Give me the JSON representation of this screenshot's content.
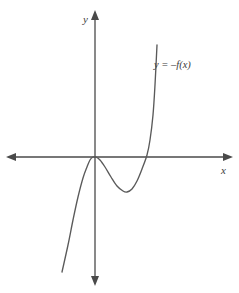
{
  "figure": {
    "width": 239,
    "height": 293,
    "background_color": "#ffffff",
    "axis_color": "#4a4a4a",
    "curve_color": "#5a5a5a",
    "text_color": "#3c3c3c"
  },
  "labels": {
    "y_axis": "y",
    "x_axis": "x",
    "curve": "y = –f(x)"
  },
  "chart_data": {
    "type": "line",
    "title": "",
    "subtitle": "",
    "xlabel": "x",
    "ylabel": "y",
    "grid": false,
    "legend_position": "none",
    "annotations": [
      {
        "text": "y = –f(x)",
        "x_px": 154,
        "y_px": 60,
        "describes": "curve"
      }
    ],
    "axes": {
      "origin_px": {
        "x": 95,
        "y": 157
      },
      "x_axis_px": {
        "x_start": 7,
        "x_end": 232,
        "y": 157,
        "arrows": "both"
      },
      "y_axis_px": {
        "y_start": 11,
        "y_end": 285,
        "x": 95,
        "arrows": "both"
      },
      "xlim": [
        -3.0,
        4.6
      ],
      "ylim": [
        -4.3,
        3.0
      ],
      "tick_labels_x": [],
      "tick_labels_y": []
    },
    "series": [
      {
        "name": "y = –f(x)",
        "color": "#5a5a5a",
        "description": "Quartic-like curve with a flat double root at the origin, decreasing to a local minimum then increasing steeply.",
        "features": {
          "x_intercepts": [
            0,
            1.75
          ],
          "double_root_at_origin": true,
          "local_maximum": {
            "x": 0,
            "y": 0
          },
          "local_minimum": {
            "x": 1.0,
            "y": -1.17
          },
          "end_behavior_left": "decreasing without bound",
          "end_behavior_right": "increasing without bound"
        },
        "points_px": [
          {
            "x": 62,
            "y": 272
          },
          {
            "x": 68,
            "y": 245
          },
          {
            "x": 73,
            "y": 220
          },
          {
            "x": 78,
            "y": 197
          },
          {
            "x": 83,
            "y": 178
          },
          {
            "x": 87,
            "y": 167
          },
          {
            "x": 90,
            "y": 160
          },
          {
            "x": 93,
            "y": 157
          },
          {
            "x": 96,
            "y": 157
          },
          {
            "x": 100,
            "y": 160
          },
          {
            "x": 105,
            "y": 167
          },
          {
            "x": 111,
            "y": 177
          },
          {
            "x": 117,
            "y": 186
          },
          {
            "x": 123,
            "y": 191
          },
          {
            "x": 127,
            "y": 192
          },
          {
            "x": 132,
            "y": 189
          },
          {
            "x": 137,
            "y": 181
          },
          {
            "x": 142,
            "y": 169
          },
          {
            "x": 147,
            "y": 155
          },
          {
            "x": 150,
            "y": 140
          },
          {
            "x": 153,
            "y": 115
          },
          {
            "x": 155,
            "y": 85
          },
          {
            "x": 157,
            "y": 45
          }
        ]
      }
    ]
  }
}
